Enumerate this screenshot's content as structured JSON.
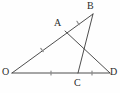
{
  "figure": {
    "kind": "geometry-diagram",
    "canvas": {
      "width": 120,
      "height": 93,
      "background": "#fefefe"
    },
    "style": {
      "stroke_color": "#3a3a3a",
      "stroke_width": 0.9,
      "tick_color": "#8a8a8a",
      "tick_width": 1.2,
      "tick_length": 4,
      "label_color": "#2b2b2b",
      "label_font_size": 10
    },
    "points": [
      {
        "id": "O",
        "label": "O",
        "x": 12,
        "y": 73,
        "label_x": 2,
        "label_y": 67
      },
      {
        "id": "A",
        "label": "A",
        "x": 65,
        "y": 31,
        "label_x": 54,
        "label_y": 18
      },
      {
        "id": "B",
        "label": "B",
        "x": 93,
        "y": 14,
        "label_x": 87,
        "label_y": 1
      },
      {
        "id": "C",
        "label": "C",
        "x": 78,
        "y": 73,
        "label_x": 74,
        "label_y": 78
      },
      {
        "id": "D",
        "label": "D",
        "x": 110,
        "y": 73,
        "label_x": 110,
        "label_y": 67
      }
    ],
    "segments": [
      {
        "id": "OB",
        "from": "O",
        "to": "B",
        "note": "passes through A"
      },
      {
        "id": "OD",
        "from": "O",
        "to": "D",
        "note": "passes through C"
      },
      {
        "id": "AD",
        "from": "A",
        "to": "D",
        "note": "cevian from A to D"
      },
      {
        "id": "BC",
        "from": "B",
        "to": "C",
        "note": "cevian from B to C"
      }
    ],
    "tick_marks": [
      {
        "id": "tick-OA",
        "on": "OA",
        "x": 42,
        "y": 50,
        "angle": -38,
        "marks": 1,
        "meaning": "OA equal mark"
      },
      {
        "id": "tick-AB",
        "on": "AB",
        "x": 78,
        "y": 23,
        "angle": -32,
        "marks": 1,
        "meaning": "AB equal mark"
      },
      {
        "id": "tick-OC",
        "on": "OC",
        "x": 51,
        "y": 73,
        "angle": 0,
        "marks": 1,
        "meaning": "OC equal mark"
      },
      {
        "id": "tick-CD",
        "on": "CD",
        "x": 92,
        "y": 73,
        "angle": 0,
        "marks": 1,
        "meaning": "CD equal mark"
      }
    ],
    "intersection": {
      "id": "AD-BC-crossing",
      "x": 79,
      "y": 46
    }
  }
}
